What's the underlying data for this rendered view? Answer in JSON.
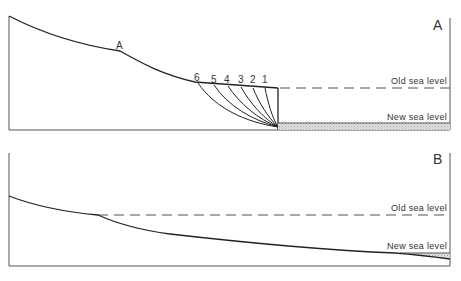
{
  "panel_a": {
    "label": "A",
    "point_label": "A",
    "old_sea_level": "Old sea level",
    "new_sea_level": "New sea level",
    "stage_numbers": [
      "6",
      "5",
      "4",
      "3",
      "2",
      "1"
    ]
  },
  "panel_b": {
    "label": "B",
    "old_sea_level": "Old sea level",
    "new_sea_level": "New sea level"
  },
  "colors": {
    "line": "#222222",
    "frame": "#555555",
    "hatch": "#bbbbbb"
  }
}
